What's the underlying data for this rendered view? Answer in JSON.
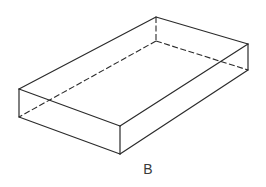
{
  "figure": {
    "label": "B",
    "shape": "rectangular-box",
    "stroke_color": "#2b2b2b",
    "background": "#ffffff",
    "vertices": {
      "top_back": [
        156,
        17
      ],
      "top_right": [
        248,
        44
      ],
      "bottom_right": [
        248,
        70
      ],
      "top_left": [
        19,
        89
      ],
      "bottom_left": [
        19,
        117
      ],
      "top_front": [
        120,
        126
      ],
      "bottom_front": [
        120,
        154
      ],
      "hidden_back": [
        156,
        41
      ]
    }
  }
}
